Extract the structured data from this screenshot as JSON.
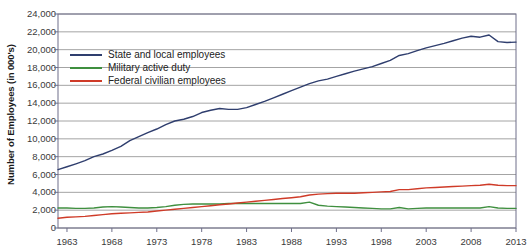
{
  "chart_data": {
    "type": "line",
    "title": "",
    "xlabel": "",
    "ylabel": "Number of Employees (in 000's)",
    "xlim": [
      1962,
      2013
    ],
    "ylim": [
      0,
      24000
    ],
    "grid": true,
    "legend_position": "upper-left-inside",
    "xticks": [
      "1963",
      "1968",
      "1973",
      "1978",
      "1983",
      "1988",
      "1993",
      "1998",
      "2003",
      "2008",
      "2013"
    ],
    "xtick_values": [
      1963,
      1968,
      1973,
      1978,
      1983,
      1988,
      1993,
      1998,
      2003,
      2008,
      2013
    ],
    "yticks": [
      "0",
      "2,000",
      "4,000",
      "6,000",
      "8,000",
      "10,000",
      "12,000",
      "14,000",
      "16,000",
      "18,000",
      "20,000",
      "22,000",
      "24,000"
    ],
    "ytick_values": [
      0,
      2000,
      4000,
      6000,
      8000,
      10000,
      12000,
      14000,
      16000,
      18000,
      20000,
      22000,
      24000
    ],
    "x": [
      1962,
      1963,
      1964,
      1965,
      1966,
      1967,
      1968,
      1969,
      1970,
      1971,
      1972,
      1973,
      1974,
      1975,
      1976,
      1977,
      1978,
      1979,
      1980,
      1981,
      1982,
      1983,
      1984,
      1985,
      1986,
      1987,
      1988,
      1989,
      1990,
      1991,
      1992,
      1993,
      1994,
      1995,
      1996,
      1997,
      1998,
      1999,
      2000,
      2001,
      2002,
      2003,
      2004,
      2005,
      2006,
      2007,
      2008,
      2009,
      2010,
      2011,
      2012,
      2013
    ],
    "series": [
      {
        "name": "State and local employees",
        "color": "#2f3e6e",
        "values": [
          6550,
          6870,
          7200,
          7550,
          8000,
          8300,
          8700,
          9150,
          9800,
          10250,
          10700,
          11100,
          11600,
          12000,
          12200,
          12500,
          12950,
          13200,
          13400,
          13300,
          13300,
          13500,
          13850,
          14200,
          14600,
          15000,
          15400,
          15800,
          16200,
          16500,
          16700,
          17000,
          17300,
          17600,
          17850,
          18100,
          18450,
          18800,
          19350,
          19550,
          19900,
          20200,
          20450,
          20700,
          21000,
          21300,
          21500,
          21400,
          21650,
          20900,
          20800,
          20850
        ]
      },
      {
        "name": "Military active duty",
        "color": "#3f8f3f",
        "values": [
          2250,
          2250,
          2200,
          2200,
          2250,
          2350,
          2400,
          2350,
          2300,
          2250,
          2250,
          2300,
          2400,
          2550,
          2650,
          2700,
          2700,
          2700,
          2700,
          2750,
          2750,
          2750,
          2750,
          2750,
          2750,
          2750,
          2750,
          2750,
          2900,
          2550,
          2450,
          2400,
          2350,
          2300,
          2250,
          2200,
          2150,
          2150,
          2300,
          2150,
          2200,
          2250,
          2250,
          2250,
          2250,
          2250,
          2250,
          2250,
          2400,
          2250,
          2200,
          2200
        ]
      },
      {
        "name": "Federal civilian employees",
        "color": "#cf3b28",
        "values": [
          1100,
          1200,
          1250,
          1300,
          1400,
          1500,
          1600,
          1650,
          1700,
          1750,
          1800,
          1900,
          2000,
          2100,
          2200,
          2300,
          2400,
          2500,
          2600,
          2700,
          2800,
          2900,
          3000,
          3100,
          3200,
          3300,
          3400,
          3500,
          3700,
          3800,
          3850,
          3900,
          3900,
          3900,
          3950,
          4000,
          4050,
          4100,
          4300,
          4300,
          4400,
          4500,
          4550,
          4600,
          4650,
          4700,
          4750,
          4800,
          4900,
          4800,
          4750,
          4750
        ]
      }
    ],
    "annotations": [
      {
        "label": "decennial-census-spike",
        "x": 1990
      },
      {
        "label": "decennial-census-spike",
        "x": 2000
      },
      {
        "label": "decennial-census-spike",
        "x": 2010
      }
    ]
  },
  "colors": {
    "state_local": "#2f3e6e",
    "military": "#3f8f3f",
    "federal": "#cf3b28",
    "grid": "#9a9a9a",
    "axis": "#6f6f8a",
    "text": "#3a3a3a",
    "background": "#ffffff"
  }
}
